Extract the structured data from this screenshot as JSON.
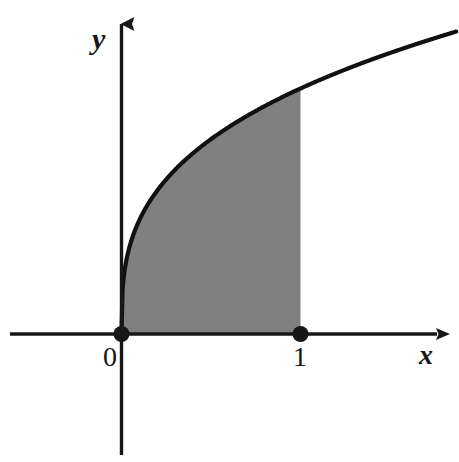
{
  "figure": {
    "background_color": "#ffffff",
    "ink_color": "#171717",
    "fill_color": "#808080",
    "curve_color": "#111111",
    "axis_labels": {
      "x": "x",
      "y": "y"
    },
    "tick_labels": {
      "x_origin": "0",
      "x_one": "1"
    },
    "points": [
      {
        "name": "origin-point",
        "label": "0",
        "x": 0,
        "y": 0
      },
      {
        "name": "x-one-point",
        "label": "1",
        "x": 1,
        "y": 0
      }
    ]
  },
  "chart_data": {
    "type": "area",
    "title": "",
    "xlabel": "x",
    "ylabel": "y",
    "grid": false,
    "legend": null,
    "xlim": [
      -0.62,
      1.87
    ],
    "ylim": [
      -0.71,
      1.8
    ],
    "shaded_region": {
      "x_from": 0,
      "x_to": 1,
      "lower_boundary": "y = 0 (x-axis)",
      "upper_boundary": "y = x^(1/3)",
      "fill": "#808080"
    },
    "series": [
      {
        "name": "y = x^(1/3)",
        "exponent": 0.3333,
        "x": [
          0,
          0.02,
          0.05,
          0.1,
          0.15,
          0.2,
          0.3,
          0.4,
          0.5,
          0.6,
          0.7,
          0.8,
          0.9,
          1.0,
          1.2,
          1.4,
          1.6,
          1.86
        ],
        "values": [
          0,
          0.27,
          0.37,
          0.46,
          0.53,
          0.58,
          0.67,
          0.74,
          0.79,
          0.84,
          0.89,
          0.93,
          0.97,
          1.0,
          1.06,
          1.12,
          1.17,
          1.23
        ]
      }
    ],
    "marked_points": [
      {
        "label": "0",
        "x": 0,
        "y": 0
      },
      {
        "label": "1",
        "x": 1,
        "y": 0
      }
    ],
    "axis_arrows": {
      "x": "right",
      "y": "up"
    }
  }
}
